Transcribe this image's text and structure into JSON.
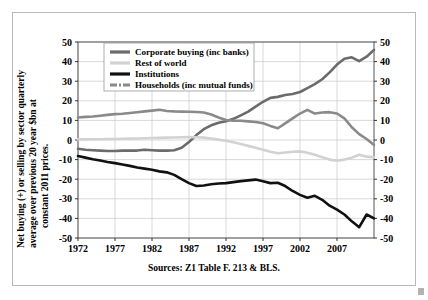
{
  "chart_data": {
    "type": "line",
    "title": "",
    "subtitle": "",
    "xlabel": "",
    "ylabel": "Net buying (+) or selling by sector quarterly average over previous 20 year $bn at constant 2011 prices.",
    "source": "Sources: Z1 Table F. 213 & BLS.",
    "xlim": [
      1972,
      2012
    ],
    "ylim": [
      -50,
      50
    ],
    "ytick_values": [
      50,
      40,
      30,
      20,
      10,
      0,
      -10,
      -20,
      -30,
      -40,
      -50
    ],
    "ytick_labels": [
      "50",
      "40",
      "30",
      "20",
      "10",
      "0",
      "-10",
      "-20",
      "-30",
      "-40",
      "-50"
    ],
    "xtick_values": [
      1972,
      1977,
      1982,
      1987,
      1992,
      1997,
      2002,
      2007
    ],
    "xtick_labels": [
      "1972",
      "1977",
      "1982",
      "1987",
      "1992",
      "1997",
      "2002",
      "2007"
    ],
    "grid": true,
    "grid_axis": "both",
    "right_axis_mirrored": true,
    "legend_position": "upper-left-inside",
    "series": [
      {
        "name": "Corporate buying (inc banks)",
        "color": "#6b6b6b",
        "legend_swatch": "thick-line",
        "x": [
          1972,
          1973,
          1974,
          1975,
          1976,
          1977,
          1978,
          1979,
          1980,
          1981,
          1982,
          1983,
          1984,
          1985,
          1986,
          1987,
          1988,
          1989,
          1990,
          1991,
          1992,
          1993,
          1994,
          1995,
          1996,
          1997,
          1998,
          1999,
          2000,
          2001,
          2002,
          2003,
          2004,
          2005,
          2006,
          2007,
          2008,
          2009,
          2010,
          2011,
          2012
        ],
        "values": [
          -4.5,
          -5.0,
          -5.2,
          -5.4,
          -5.6,
          -5.6,
          -5.4,
          -5.4,
          -5.4,
          -5.0,
          -5.2,
          -5.4,
          -5.4,
          -5.2,
          -4.0,
          -1.0,
          2.5,
          5.5,
          7.5,
          8.8,
          9.6,
          10.8,
          12.6,
          14.5,
          17.0,
          19.5,
          21.5,
          22.0,
          23.0,
          23.5,
          24.5,
          26.5,
          28.5,
          31.0,
          34.5,
          38.5,
          41.5,
          42.2,
          40.2,
          42.5,
          46.0
        ]
      },
      {
        "name": "Rest of world",
        "color": "#d2d2d2",
        "legend_swatch": "thick-line-light",
        "x": [
          1972,
          1973,
          1974,
          1975,
          1976,
          1977,
          1978,
          1979,
          1980,
          1981,
          1982,
          1983,
          1984,
          1985,
          1986,
          1987,
          1988,
          1989,
          1990,
          1991,
          1992,
          1993,
          1994,
          1995,
          1996,
          1997,
          1998,
          1999,
          2000,
          2001,
          2002,
          2003,
          2004,
          2005,
          2006,
          2007,
          2008,
          2009,
          2010,
          2011,
          2012
        ],
        "values": [
          0.3,
          0.3,
          0.4,
          0.4,
          0.5,
          0.5,
          0.6,
          0.7,
          0.8,
          0.9,
          1.0,
          1.1,
          1.2,
          1.3,
          1.4,
          1.5,
          1.4,
          1.2,
          0.7,
          0.2,
          -0.4,
          -1.2,
          -2.0,
          -3.0,
          -4.0,
          -5.0,
          -6.0,
          -6.8,
          -6.4,
          -6.0,
          -5.8,
          -6.5,
          -7.5,
          -8.8,
          -10.0,
          -10.6,
          -10.0,
          -9.0,
          -7.5,
          -8.5,
          -8.8
        ]
      },
      {
        "name": "Institutions",
        "color": "#111111",
        "legend_swatch": "thick-line-dark",
        "x": [
          1972,
          1973,
          1974,
          1975,
          1976,
          1977,
          1978,
          1979,
          1980,
          1981,
          1982,
          1983,
          1984,
          1985,
          1986,
          1987,
          1988,
          1989,
          1990,
          1991,
          1992,
          1993,
          1994,
          1995,
          1996,
          1997,
          1998,
          1999,
          2000,
          2001,
          2002,
          2003,
          2004,
          2005,
          2006,
          2007,
          2008,
          2009,
          2010,
          2011,
          2012
        ],
        "values": [
          -8.2,
          -9.0,
          -9.8,
          -10.5,
          -11.2,
          -11.8,
          -12.5,
          -13.2,
          -14.0,
          -14.6,
          -15.2,
          -16.0,
          -16.5,
          -17.8,
          -20.0,
          -22.0,
          -23.5,
          -23.2,
          -22.6,
          -22.2,
          -22.0,
          -21.5,
          -21.0,
          -20.6,
          -20.2,
          -21.0,
          -22.0,
          -21.8,
          -23.5,
          -26.0,
          -28.0,
          -29.5,
          -28.5,
          -30.5,
          -33.5,
          -35.5,
          -38.0,
          -41.5,
          -44.5,
          -38.0,
          -40.0
        ]
      },
      {
        "name": "Households (inc mutual funds)",
        "color": "#8a8a8a",
        "legend_swatch": "thick-line-dash",
        "x": [
          1972,
          1973,
          1974,
          1975,
          1976,
          1977,
          1978,
          1979,
          1980,
          1981,
          1982,
          1983,
          1984,
          1985,
          1986,
          1987,
          1988,
          1989,
          1990,
          1991,
          1992,
          1993,
          1994,
          1995,
          1996,
          1997,
          1998,
          1999,
          2000,
          2001,
          2002,
          2003,
          2004,
          2005,
          2006,
          2007,
          2008,
          2009,
          2010,
          2011,
          2012
        ],
        "values": [
          11.5,
          11.8,
          12.0,
          12.4,
          12.8,
          13.2,
          13.4,
          13.8,
          14.2,
          14.6,
          15.0,
          15.4,
          14.8,
          14.6,
          14.5,
          14.4,
          14.3,
          14.0,
          13.0,
          11.5,
          10.2,
          9.8,
          9.8,
          9.5,
          9.2,
          8.5,
          7.2,
          6.0,
          8.5,
          11.0,
          13.5,
          15.4,
          13.5,
          14.0,
          14.2,
          13.5,
          11.0,
          6.5,
          3.0,
          0.5,
          -2.5
        ]
      }
    ]
  },
  "legend": {
    "items": [
      {
        "label": "Corporate buying (inc banks)"
      },
      {
        "label": "Rest of world"
      },
      {
        "label": "Institutions"
      },
      {
        "label": "Households (inc mutual funds)"
      }
    ]
  },
  "ylabel": {
    "line1": "Net buying (+) or selling by sector quarterly",
    "line2": "average over previous 20 year $bn at",
    "line3": "constant 2011 prices."
  },
  "source": {
    "text": "Sources: Z1 Table F. 213 & BLS."
  },
  "axes": {
    "ytick_labels": [
      "50",
      "40",
      "30",
      "20",
      "10",
      "0",
      "-10",
      "-20",
      "-30",
      "-40",
      "-50"
    ],
    "xtick_labels": [
      "1972",
      "1977",
      "1982",
      "1987",
      "1992",
      "1997",
      "2002",
      "2007"
    ]
  }
}
